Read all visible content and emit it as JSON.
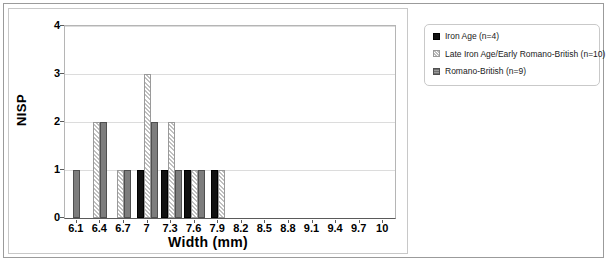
{
  "chart_data": {
    "type": "bar",
    "title": "",
    "xlabel": "Width (mm)",
    "ylabel": "NISP",
    "categories": [
      "6.1",
      "6.4",
      "6.7",
      "7",
      "7.3",
      "7.6",
      "7.9",
      "8.2",
      "8.5",
      "8.8",
      "9.1",
      "9.4",
      "9.7",
      "10"
    ],
    "series": [
      {
        "name": "Iron Age (n=4)",
        "values": [
          0,
          0,
          0,
          1,
          1,
          1,
          1,
          0,
          0,
          0,
          0,
          0,
          0,
          0
        ],
        "fill": "solid-black",
        "color": "#111111"
      },
      {
        "name": "Late Iron Age/Early Romano-British (n=10)",
        "values": [
          0,
          2,
          1,
          3,
          2,
          1,
          1,
          0,
          0,
          0,
          0,
          0,
          0,
          0
        ],
        "fill": "diagonal-hatch",
        "color": "#ffffff"
      },
      {
        "name": "Romano-British (n=9)",
        "values": [
          1,
          2,
          1,
          2,
          1,
          1,
          0,
          0,
          0,
          0,
          0,
          0,
          0,
          0
        ],
        "fill": "solid-grey",
        "color": "#7d7d7d"
      }
    ],
    "ylim": [
      0,
      4
    ],
    "yticks": [
      "0",
      "1",
      "2",
      "3",
      "4"
    ],
    "grid": "horizontal",
    "legend_position": "right"
  },
  "legend": {
    "items": [
      {
        "label": "Iron Age (n=4)",
        "swatch": "solid-black-swatch"
      },
      {
        "label": "Late Iron Age/Early Romano-British (n=10)",
        "swatch": "hatched-swatch"
      },
      {
        "label": "Romano-British (n=9)",
        "swatch": "grey-swatch"
      }
    ]
  }
}
